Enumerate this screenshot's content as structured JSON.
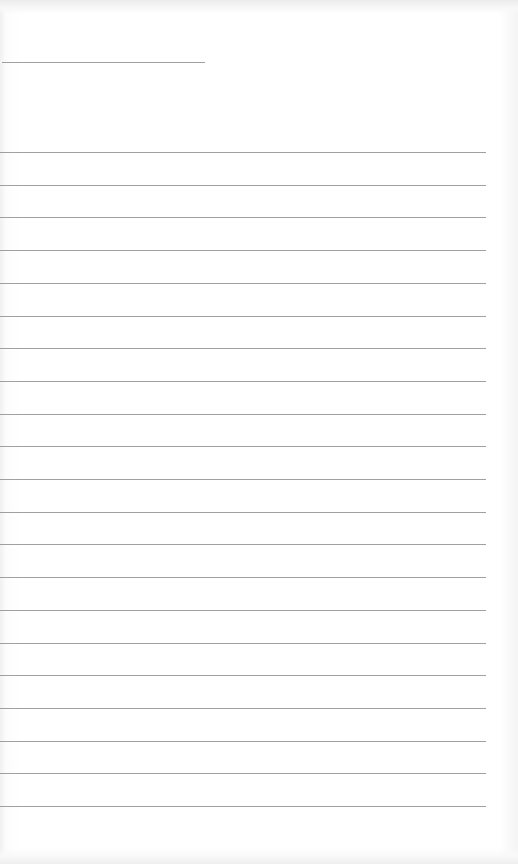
{
  "document": {
    "type": "lined-paper",
    "header_line": {
      "x": 2,
      "y": 62,
      "width": 203
    },
    "ruled_lines": {
      "count": 21,
      "start_y": 152,
      "spacing": 32.7,
      "x": 0,
      "width": 486
    },
    "colors": {
      "paper": "#ffffff",
      "line": "#8f8f8f"
    }
  }
}
